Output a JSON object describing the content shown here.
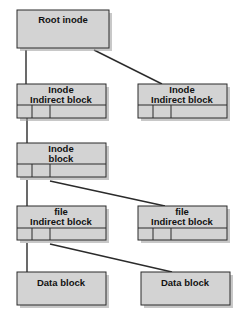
{
  "diagram": {
    "background_color": "#ffffff",
    "box_fill_color": "#d3d3d3",
    "box_stroke_color": "#2b2b2b",
    "connector_color": "#2b2b2b",
    "nodes": [
      {
        "id": "root-inode",
        "label_line1": "Root inode",
        "label_line2": "",
        "has_slot_row": false,
        "slot_count": 0
      },
      {
        "id": "inode-indirect-block-left",
        "label_line1": "Inode",
        "label_line2": "Indirect block",
        "has_slot_row": true,
        "slot_count": 3
      },
      {
        "id": "inode-indirect-block-right",
        "label_line1": "Inode",
        "label_line2": "Indirect block",
        "has_slot_row": true,
        "slot_count": 3
      },
      {
        "id": "inode-block",
        "label_line1": "Inode",
        "label_line2": "block",
        "has_slot_row": true,
        "slot_count": 3
      },
      {
        "id": "file-indirect-block-left",
        "label_line1": "file",
        "label_line2": "Indirect block",
        "has_slot_row": true,
        "slot_count": 3
      },
      {
        "id": "file-indirect-block-right",
        "label_line1": "file",
        "label_line2": "Indirect block",
        "has_slot_row": true,
        "slot_count": 3
      },
      {
        "id": "data-block-left",
        "label_line1": "Data block",
        "label_line2": "",
        "has_slot_row": false,
        "slot_count": 0
      },
      {
        "id": "data-block-right",
        "label_line1": "Data block",
        "label_line2": "",
        "has_slot_row": false,
        "slot_count": 0
      }
    ],
    "edges": [
      {
        "id": "root-to-inode-indirect-left",
        "from": "root-inode",
        "to": "inode-indirect-block-left",
        "style": "vertical"
      },
      {
        "id": "root-to-inode-indirect-right",
        "from": "root-inode",
        "to": "inode-indirect-block-right",
        "style": "diagonal"
      },
      {
        "id": "inode-indirect-left-to-inode-block",
        "from": "inode-indirect-block-left",
        "to": "inode-block",
        "style": "vertical"
      },
      {
        "id": "inode-block-to-file-indirect-left",
        "from": "inode-block",
        "to": "file-indirect-block-left",
        "style": "vertical"
      },
      {
        "id": "inode-block-to-file-indirect-right",
        "from": "inode-block",
        "to": "file-indirect-block-right",
        "style": "diagonal"
      },
      {
        "id": "file-indirect-left-to-data-block-left",
        "from": "file-indirect-block-left",
        "to": "data-block-left",
        "style": "vertical"
      },
      {
        "id": "file-indirect-left-to-data-block-right",
        "from": "file-indirect-block-left",
        "to": "data-block-right",
        "style": "diagonal"
      }
    ]
  }
}
